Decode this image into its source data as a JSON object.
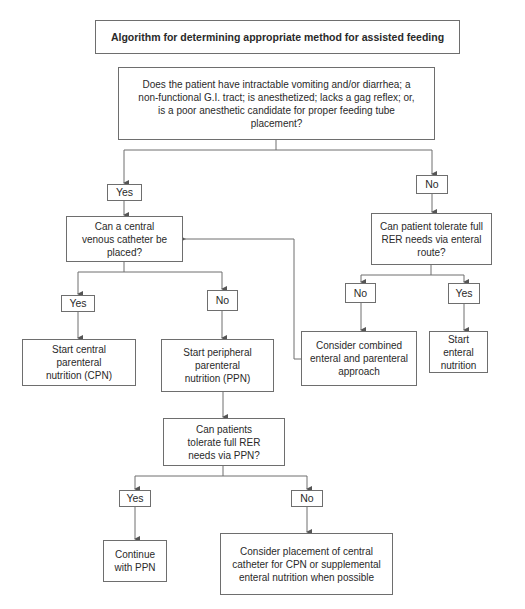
{
  "title": "Algorithm for determining appropriate method for assisted feeding",
  "nodes": {
    "q_start": "Does the patient have intractable vomiting and/or diarrhea; a non-functional G.I. tract; is anesthetized; lacks a gag reflex; or, is a poor anesthetic candidate for proper feeding tube placement?",
    "yes_1": "Yes",
    "no_1": "No",
    "q_central": "Can a central venous catheter be placed?",
    "q_enteral": "Can patient tolerate full RER needs via enteral route?",
    "yes_2": "Yes",
    "no_2": "No",
    "no_3": "No",
    "yes_3": "Yes",
    "start_cpn": "Start central parenteral nutrition (CPN)",
    "start_ppn": "Start peripheral parenteral nutrition (PPN)",
    "combined": "Consider combined enteral and parenteral approach",
    "start_enteral": "Start enteral nutrition",
    "q_ppn": "Can patients tolerate full RER needs via PPN?",
    "yes_4": "Yes",
    "no_4": "No",
    "continue_ppn": "Continue with PPN",
    "consider_central": "Consider placement of central catheter for CPN or supplemental enteral nutrition when possible"
  },
  "colors": {
    "line": "#6e6e6e",
    "text": "#2a2a2a",
    "background": "#ffffff"
  }
}
